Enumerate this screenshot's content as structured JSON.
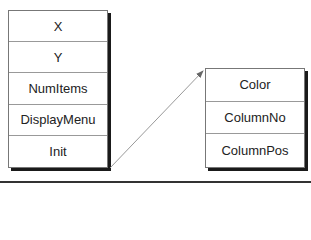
{
  "left_box": {
    "fields": [
      {
        "label": "X"
      },
      {
        "label": "Y"
      },
      {
        "label": "NumItems"
      },
      {
        "label": "DisplayMenu"
      },
      {
        "label": "Init"
      }
    ]
  },
  "right_box": {
    "fields": [
      {
        "label": "Color"
      },
      {
        "label": "ColumnNo"
      },
      {
        "label": "ColumnPos"
      }
    ]
  },
  "arrow": {
    "from": "Init",
    "to": "right_box",
    "color": "#888888"
  }
}
